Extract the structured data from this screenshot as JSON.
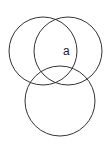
{
  "diagram": {
    "type": "venn",
    "circles": [
      {
        "name": "left",
        "cx": 43,
        "cy": 51,
        "r": 34
      },
      {
        "name": "right",
        "cx": 68,
        "cy": 51,
        "r": 34
      },
      {
        "name": "bottom",
        "cx": 60,
        "cy": 101,
        "r": 35
      }
    ],
    "labels": [
      {
        "text": "a",
        "x": 63,
        "y": 55
      }
    ],
    "stroke_color": "#333333"
  }
}
